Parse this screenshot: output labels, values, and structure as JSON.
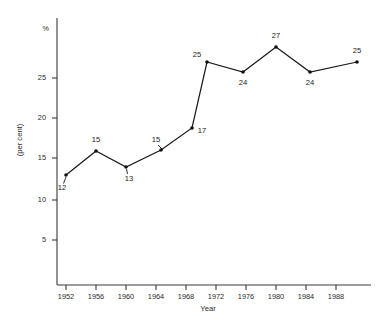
{
  "chart_data": {
    "type": "line",
    "title": "",
    "xlabel": "Year",
    "ylabel": "(per cent)",
    "unit_symbol": "%",
    "grid": false,
    "legend": "none",
    "xlim": [
      1950,
      1992
    ],
    "ylim": [
      0,
      28
    ],
    "x_ticks": [
      1952,
      1956,
      1960,
      1964,
      1968,
      1972,
      1976,
      1980,
      1984,
      1988
    ],
    "x_tick_labels": [
      "1952",
      "1956",
      "1960",
      "1964",
      "1968",
      "1972",
      "1976",
      "1980",
      "1984",
      "1988"
    ],
    "y_ticks": [
      5,
      10,
      15,
      20,
      25
    ],
    "y_tick_labels": [
      "5",
      "10",
      "15",
      "20",
      "25"
    ],
    "series": [
      {
        "name": "",
        "x": [
          1952,
          1956,
          1960,
          1966,
          1969,
          1971,
          1975,
          1979,
          1983,
          1988.5
        ],
        "values": [
          12,
          15,
          13,
          15,
          17,
          25,
          24,
          27,
          24,
          25
        ],
        "point_labels": [
          "12",
          "15",
          "13",
          "15",
          "17",
          "25",
          "24",
          "27",
          "24",
          "25"
        ]
      }
    ]
  },
  "geometry": {
    "points": [
      {
        "label": "12",
        "px": 66,
        "py": 175,
        "lx": 62,
        "ly": 190,
        "leader": [
          63.5,
          183.5,
          66,
          177
        ]
      },
      {
        "label": "15",
        "px": 96,
        "py": 151,
        "lx": 96,
        "ly": 142,
        "leader": null
      },
      {
        "label": "13",
        "px": 126,
        "py": 167,
        "lx": 129,
        "ly": 181,
        "leader": [
          127.5,
          174,
          126.5,
          169
        ]
      },
      {
        "label": "15",
        "px": 161,
        "py": 150,
        "lx": 156,
        "ly": 142,
        "leader": [
          158,
          145,
          163,
          150
        ]
      },
      {
        "label": "17",
        "px": 192,
        "py": 128,
        "lx": 202,
        "ly": 133,
        "leader": null
      },
      {
        "label": "25",
        "px": 207,
        "py": 62,
        "lx": 197,
        "ly": 57,
        "leader": null
      },
      {
        "label": "24",
        "px": 243,
        "py": 72,
        "lx": 243,
        "ly": 85,
        "leader": null
      },
      {
        "label": "27",
        "px": 276,
        "py": 47,
        "lx": 276,
        "ly": 38,
        "leader": null
      },
      {
        "label": "24",
        "px": 310,
        "py": 72,
        "lx": 310,
        "ly": 85,
        "leader": null
      },
      {
        "label": "25",
        "px": 357,
        "py": 62,
        "lx": 357,
        "ly": 53,
        "leader": null
      }
    ],
    "y_tick_px": [
      {
        "v": "5",
        "py": 240
      },
      {
        "v": "10",
        "py": 200
      },
      {
        "v": "15",
        "py": 158
      },
      {
        "v": "20",
        "py": 118
      },
      {
        "v": "25",
        "py": 78
      }
    ],
    "x_tick_px": [
      {
        "v": "1952",
        "px": 66
      },
      {
        "v": "1956",
        "px": 96
      },
      {
        "v": "1960",
        "px": 126
      },
      {
        "v": "1964",
        "px": 156
      },
      {
        "v": "1968",
        "px": 186
      },
      {
        "v": "1972",
        "px": 216
      },
      {
        "v": "1976",
        "px": 246
      },
      {
        "v": "1980",
        "px": 276
      },
      {
        "v": "1984",
        "px": 306
      },
      {
        "v": "1988",
        "px": 336
      }
    ]
  },
  "colors": {
    "line": "#1b1b1b",
    "axis": "#3a3a3a",
    "text": "#2b2b2b",
    "background": "#ffffff"
  }
}
